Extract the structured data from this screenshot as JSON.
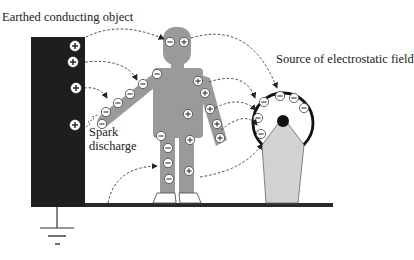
{
  "labels": {
    "earthed_object": "Earthed conducting object",
    "source": "Source of electrostatic field",
    "spark_line1": "Spark",
    "spark_line2": "discharge"
  },
  "charges": {
    "positive_symbol": "+",
    "negative_symbol": "−"
  },
  "colors": {
    "earthed_object": "#1e1e1e",
    "body": "#9a9a9a",
    "source_base": "#d2d2d2",
    "floor": "#2a2a2a",
    "arrow": "#333333"
  }
}
